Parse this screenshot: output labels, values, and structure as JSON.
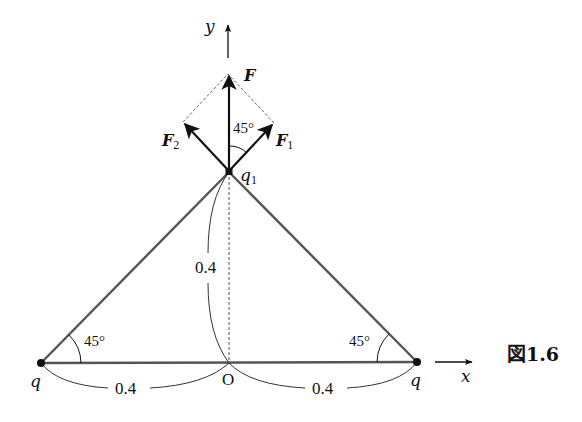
{
  "figure": {
    "caption": "図1.6",
    "axes": {
      "x_label": "x",
      "y_label": "y",
      "origin_label": "O"
    },
    "charges": {
      "left": "q",
      "right": "q",
      "top_main": "q",
      "top_sub": "1"
    },
    "forces": {
      "resultant": "F",
      "f1_main": "F",
      "f1_sub": "1",
      "f2_main": "F",
      "f2_sub": "2"
    },
    "angles": {
      "between_F_F1": "45°",
      "left_base": "45°",
      "right_base": "45°"
    },
    "distances": {
      "vertical": "0.4",
      "left_horizontal": "0.4",
      "right_horizontal": "0.4"
    },
    "colors": {
      "ink": "#111111",
      "rod": "#555555",
      "dashed": "#666666"
    }
  }
}
